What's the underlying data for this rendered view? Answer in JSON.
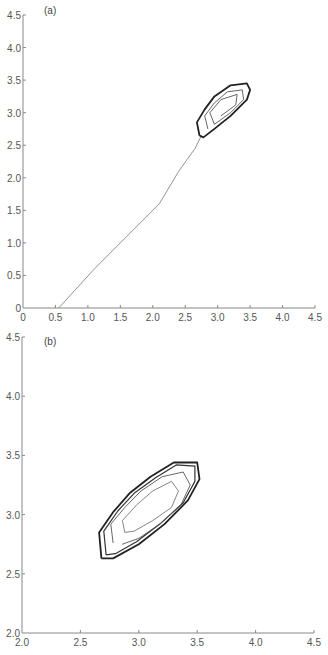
{
  "chart_data": [
    {
      "panel": "(a)",
      "type": "line",
      "title": "",
      "xlabel": "",
      "ylabel": "",
      "xlim": [
        0,
        4.5
      ],
      "ylim": [
        0,
        4.5
      ],
      "grid": false,
      "xticks": [
        "0",
        "0.5",
        "1.0",
        "1.5",
        "2.0",
        "2.5",
        "3.0",
        "3.5",
        "4.0",
        "4.5"
      ],
      "yticks": [
        "0",
        "0.5",
        "1.0",
        "1.5",
        "2.0",
        "2.5",
        "3.0",
        "3.5",
        "4.0",
        "4.5"
      ],
      "series": [
        {
          "name": "transient trajectory",
          "points": [
            [
              0.55,
              0.0
            ],
            [
              1.1,
              0.6
            ],
            [
              1.6,
              1.1
            ],
            [
              2.1,
              1.6
            ],
            [
              2.4,
              2.1
            ],
            [
              2.65,
              2.45
            ],
            [
              2.75,
              2.65
            ]
          ]
        },
        {
          "name": "limit cycle (outer)",
          "points": [
            [
              2.72,
              2.65
            ],
            [
              2.68,
              2.85
            ],
            [
              2.8,
              3.05
            ],
            [
              2.95,
              3.25
            ],
            [
              3.2,
              3.42
            ],
            [
              3.45,
              3.45
            ],
            [
              3.5,
              3.35
            ],
            [
              3.45,
              3.2
            ],
            [
              3.2,
              2.95
            ],
            [
              2.95,
              2.75
            ],
            [
              2.78,
              2.62
            ],
            [
              2.72,
              2.65
            ]
          ]
        },
        {
          "name": "spiral (inner)",
          "points": [
            [
              2.85,
              2.75
            ],
            [
              2.8,
              2.95
            ],
            [
              2.95,
              3.15
            ],
            [
              3.15,
              3.32
            ],
            [
              3.38,
              3.35
            ],
            [
              3.4,
              3.2
            ],
            [
              3.2,
              3.0
            ],
            [
              2.95,
              2.82
            ],
            [
              2.88,
              3.0
            ],
            [
              3.05,
              3.2
            ],
            [
              3.3,
              3.28
            ],
            [
              3.28,
              3.12
            ],
            [
              3.05,
              2.95
            ]
          ]
        }
      ]
    },
    {
      "panel": "(b)",
      "type": "line",
      "title": "",
      "xlabel": "",
      "ylabel": "",
      "xlim": [
        2.0,
        4.5
      ],
      "ylim": [
        2.0,
        4.5
      ],
      "grid": false,
      "xticks": [
        "2.0",
        "2.5",
        "3.0",
        "3.5",
        "4.0",
        "4.5"
      ],
      "yticks": [
        "2.0",
        "2.5",
        "3.0",
        "3.5",
        "4.0",
        "4.5"
      ],
      "series": [
        {
          "name": "limit cycle (outer)",
          "points": [
            [
              2.68,
              2.63
            ],
            [
              2.66,
              2.85
            ],
            [
              2.78,
              3.02
            ],
            [
              2.92,
              3.18
            ],
            [
              3.1,
              3.32
            ],
            [
              3.3,
              3.44
            ],
            [
              3.5,
              3.44
            ],
            [
              3.52,
              3.3
            ],
            [
              3.42,
              3.12
            ],
            [
              3.22,
              2.92
            ],
            [
              3.0,
              2.75
            ],
            [
              2.78,
              2.63
            ],
            [
              2.68,
              2.63
            ]
          ]
        },
        {
          "name": "cycle 2",
          "points": [
            [
              2.72,
              2.66
            ],
            [
              2.7,
              2.86
            ],
            [
              2.82,
              3.03
            ],
            [
              2.96,
              3.18
            ],
            [
              3.14,
              3.31
            ],
            [
              3.32,
              3.42
            ],
            [
              3.48,
              3.41
            ],
            [
              3.48,
              3.28
            ],
            [
              3.38,
              3.1
            ],
            [
              3.18,
              2.92
            ],
            [
              2.98,
              2.77
            ],
            [
              2.8,
              2.67
            ],
            [
              2.72,
              2.66
            ]
          ]
        },
        {
          "name": "spiral 1",
          "points": [
            [
              2.78,
              2.76
            ],
            [
              2.76,
              2.92
            ],
            [
              2.88,
              3.06
            ],
            [
              3.02,
              3.2
            ],
            [
              3.2,
              3.32
            ],
            [
              3.38,
              3.36
            ],
            [
              3.44,
              3.25
            ],
            [
              3.36,
              3.08
            ],
            [
              3.18,
              2.92
            ],
            [
              3.0,
              2.8
            ],
            [
              2.86,
              2.75
            ]
          ]
        },
        {
          "name": "spiral 2 (innermost)",
          "points": [
            [
              2.88,
              2.85
            ],
            [
              2.86,
              2.95
            ],
            [
              2.98,
              3.08
            ],
            [
              3.12,
              3.2
            ],
            [
              3.28,
              3.28
            ],
            [
              3.34,
              3.2
            ],
            [
              3.28,
              3.06
            ],
            [
              3.12,
              2.95
            ],
            [
              2.96,
              2.86
            ],
            [
              2.88,
              2.85
            ]
          ]
        }
      ]
    }
  ],
  "panels": {
    "a": {
      "label": "(a)"
    },
    "b": {
      "label": "(b)"
    }
  },
  "colors": {
    "axis": "#888888",
    "trajectory": "#777777",
    "loop_outer": "#222222",
    "loop_inner": "#555555"
  }
}
